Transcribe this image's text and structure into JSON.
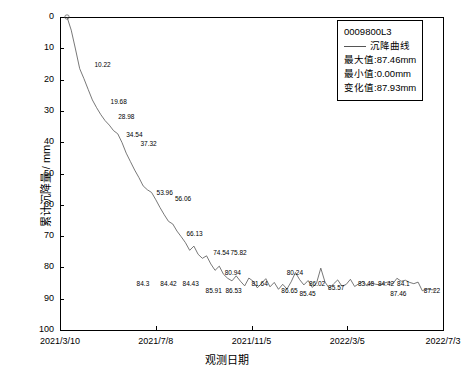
{
  "chart_data": {
    "type": "line",
    "title": "",
    "xlabel": "观测日期",
    "ylabel": "累计沉降量 / mm",
    "ylim": [
      0,
      100
    ],
    "y_inverted": true,
    "yticks": [
      0,
      10,
      20,
      30,
      40,
      50,
      60,
      70,
      80,
      90,
      100
    ],
    "xticks": [
      "2021/3/10",
      "2021/7/8",
      "2021/11/5",
      "2022/3/5",
      "2022/7/3"
    ],
    "grid": false,
    "legend_position": "top-right",
    "series": [
      {
        "name": "沉降曲线",
        "color": "#555555",
        "x": [
          0,
          1,
          2,
          3,
          4,
          5,
          6,
          7,
          8,
          9,
          10,
          11,
          12,
          13,
          14,
          15,
          16,
          17,
          18,
          19,
          20,
          21,
          22,
          23,
          24,
          25,
          26,
          27,
          28,
          29,
          30,
          31,
          32,
          33,
          34,
          35,
          36,
          37,
          38,
          39,
          40,
          41,
          42,
          43,
          44,
          45,
          46,
          47,
          48,
          49,
          50,
          51,
          52,
          53,
          54,
          55,
          56,
          57,
          58,
          59,
          60,
          61,
          62,
          63,
          64,
          65,
          66,
          67,
          68,
          69,
          70,
          71,
          72,
          73,
          74,
          75,
          76,
          77,
          78,
          79,
          80,
          81,
          82,
          83,
          84,
          85,
          86,
          87
        ],
        "values": [
          0.0,
          4.2,
          10.22,
          16.5,
          19.68,
          23.12,
          26.5,
          28.98,
          31.2,
          33.1,
          34.54,
          36.3,
          37.32,
          40.1,
          43.5,
          46.2,
          48.9,
          51.3,
          53.96,
          55.2,
          56.06,
          58.4,
          60.9,
          63.2,
          65.3,
          66.13,
          68.4,
          70.2,
          72.1,
          74.54,
          73.2,
          75.82,
          77.1,
          76.3,
          78.9,
          80.94,
          79.6,
          82.2,
          83.5,
          84.3,
          82.7,
          84.42,
          85.91,
          83.4,
          84.43,
          86.53,
          85.1,
          83.6,
          86.2,
          84.8,
          87.0,
          85.4,
          86.9,
          84.6,
          81.64,
          83.9,
          85.6,
          84.2,
          86.4,
          85.0,
          80.24,
          84.7,
          86.65,
          85.3,
          84.0,
          86.02,
          85.45,
          83.8,
          86.1,
          85.2,
          84.5,
          85.9,
          84.9,
          85.4,
          85.57,
          85.0,
          84.6,
          85.3,
          83.48,
          84.42,
          84.1,
          84.8,
          85.2,
          84.7,
          87.46,
          86.9,
          87.1,
          87.22
        ]
      }
    ],
    "point_labels": [
      {
        "text": "10.22",
        "x": 0.09,
        "y": 0.142
      },
      {
        "text": "19.68",
        "x": 0.132,
        "y": 0.258
      },
      {
        "text": "28.98",
        "x": 0.152,
        "y": 0.308
      },
      {
        "text": "34.54",
        "x": 0.173,
        "y": 0.365
      },
      {
        "text": "37.32",
        "x": 0.21,
        "y": 0.392
      },
      {
        "text": "53.96",
        "x": 0.252,
        "y": 0.548
      },
      {
        "text": "56.06",
        "x": 0.3,
        "y": 0.57
      },
      {
        "text": "66.13",
        "x": 0.33,
        "y": 0.68
      },
      {
        "text": "74.54",
        "x": 0.4,
        "y": 0.742
      },
      {
        "text": "75.82",
        "x": 0.445,
        "y": 0.742
      },
      {
        "text": "80.94",
        "x": 0.43,
        "y": 0.805
      },
      {
        "text": "84.3",
        "x": 0.2,
        "y": 0.84
      },
      {
        "text": "84.42",
        "x": 0.262,
        "y": 0.84
      },
      {
        "text": "84.43",
        "x": 0.32,
        "y": 0.84
      },
      {
        "text": "85.91",
        "x": 0.38,
        "y": 0.862
      },
      {
        "text": "86.53",
        "x": 0.432,
        "y": 0.862
      },
      {
        "text": "81.64",
        "x": 0.5,
        "y": 0.84
      },
      {
        "text": "80.24",
        "x": 0.592,
        "y": 0.805
      },
      {
        "text": "86.65",
        "x": 0.578,
        "y": 0.862
      },
      {
        "text": "86.02",
        "x": 0.65,
        "y": 0.84
      },
      {
        "text": "85.45",
        "x": 0.625,
        "y": 0.872
      },
      {
        "text": "85.57",
        "x": 0.7,
        "y": 0.852
      },
      {
        "text": "83.48",
        "x": 0.778,
        "y": 0.84
      },
      {
        "text": "84.42",
        "x": 0.83,
        "y": 0.84
      },
      {
        "text": "84.1",
        "x": 0.88,
        "y": 0.84
      },
      {
        "text": "87.46",
        "x": 0.862,
        "y": 0.872
      },
      {
        "text": "87.22",
        "x": 0.95,
        "y": 0.862
      }
    ]
  },
  "legend": {
    "title": "0009800L3",
    "series_label": "沉降曲线",
    "stats": [
      "最大值:87.46mm",
      "最小值:0.00mm",
      "变化值:87.93mm"
    ]
  }
}
